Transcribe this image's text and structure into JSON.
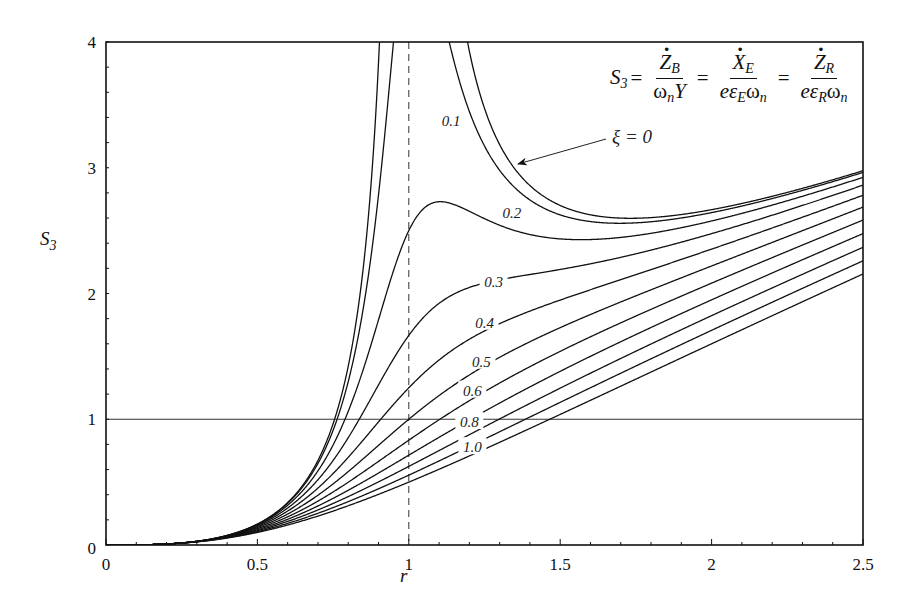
{
  "chart_data": {
    "type": "line",
    "title": "",
    "xlabel": "r",
    "ylabel": "S3",
    "xlim": [
      0,
      2.5
    ],
    "ylim": [
      0,
      4
    ],
    "grid": false,
    "x_ticks": [
      "0",
      "0.5",
      "1",
      "1.5",
      "2",
      "2.5"
    ],
    "y_ticks": [
      "0",
      "1",
      "2",
      "3",
      "4"
    ],
    "reference_lines": [
      {
        "type": "horizontal",
        "y": 1,
        "style": "solid"
      },
      {
        "type": "vertical",
        "x": 1,
        "style": "dashed"
      }
    ],
    "formula": "S3 = Ż_B/(ω_n Y) = Ẋ_E/(e ε_E ω_n) = Ż_R/(e ε_R ω_n)",
    "model": "S3 = r^3 / sqrt((1 - r^2)^2 + (2*xi*r)^2)",
    "annotation": {
      "text": "ξ = 0",
      "points_to_series": "ξ=0"
    },
    "x": [
      0,
      0.25,
      0.5,
      0.75,
      1.0,
      1.1,
      1.25,
      1.5,
      1.75,
      2.0,
      2.25,
      2.5
    ],
    "series": [
      {
        "name": "ξ=0",
        "label": "",
        "values": [
          0,
          0.017,
          0.167,
          0.964,
          null,
          6.34,
          3.47,
          2.7,
          2.6,
          2.67,
          2.8,
          2.98
        ]
      },
      {
        "name": "ξ=0.1",
        "label": "0.1",
        "values": [
          0,
          0.017,
          0.166,
          0.942,
          5.0,
          4.51,
          3.36,
          2.67,
          2.59,
          2.66,
          2.8,
          2.97
        ]
      },
      {
        "name": "ξ=0.2",
        "label": "0.2",
        "values": [
          0,
          0.016,
          0.163,
          0.886,
          2.5,
          2.73,
          2.92,
          2.55,
          2.54,
          2.63,
          2.78,
          2.96
        ]
      },
      {
        "name": "ξ=0.3",
        "label": "0.3",
        "values": [
          0,
          0.016,
          0.159,
          0.814,
          1.67,
          1.96,
          2.26,
          2.32,
          2.45,
          2.59,
          2.75,
          2.93
        ]
      },
      {
        "name": "ξ=0.4",
        "label": "0.4",
        "values": [
          0,
          0.016,
          0.153,
          0.739,
          1.25,
          1.48,
          1.88,
          2.1,
          2.33,
          2.53,
          2.71,
          2.89
        ]
      },
      {
        "name": "ξ=0.5",
        "label": "0.5",
        "values": [
          0,
          0.016,
          0.147,
          0.668,
          1.0,
          1.19,
          1.5,
          1.88,
          2.18,
          2.44,
          2.66,
          2.85
        ]
      },
      {
        "name": "ξ=0.6",
        "label": "0.6",
        "values": [
          0,
          0.015,
          0.14,
          0.605,
          0.833,
          0.99,
          1.25,
          1.67,
          2.02,
          2.33,
          2.59,
          2.8
        ]
      },
      {
        "name": "ξ=0.7",
        "label": "",
        "values": [
          0,
          0.015,
          0.133,
          0.55,
          0.714,
          0.85,
          1.07,
          1.49,
          1.86,
          2.22,
          2.51,
          2.74
        ]
      },
      {
        "name": "ξ=0.8",
        "label": "0.8",
        "values": [
          0,
          0.014,
          0.127,
          0.502,
          0.625,
          0.74,
          0.94,
          1.34,
          1.72,
          2.1,
          2.43,
          2.68
        ]
      },
      {
        "name": "ξ=0.9",
        "label": "",
        "values": [
          0,
          0.014,
          0.12,
          0.461,
          0.556,
          0.66,
          0.83,
          1.21,
          1.59,
          1.99,
          2.34,
          2.62
        ]
      },
      {
        "name": "ξ=1.0",
        "label": "1.0",
        "values": [
          0,
          0.014,
          0.114,
          0.425,
          0.5,
          0.58,
          0.75,
          1.1,
          1.48,
          1.89,
          2.25,
          2.16
        ]
      }
    ],
    "xi_values": [
      0,
      0.1,
      0.2,
      0.3,
      0.4,
      0.5,
      0.6,
      0.7,
      0.8,
      0.9,
      1.0
    ],
    "curve_labels": [
      {
        "text": "0.1",
        "xi": 0.1,
        "x": 1.14,
        "y": 3.36
      },
      {
        "text": "0.2",
        "xi": 0.2,
        "x": 1.34,
        "y": 2.63
      },
      {
        "text": "0.3",
        "xi": 0.3,
        "x": 1.28,
        "y": 2.08
      },
      {
        "text": "0.4",
        "xi": 0.4,
        "x": 1.25,
        "y": 1.76
      },
      {
        "text": "0.5",
        "xi": 0.5,
        "x": 1.24,
        "y": 1.45
      },
      {
        "text": "0.6",
        "xi": 0.6,
        "x": 1.21,
        "y": 1.22
      },
      {
        "text": "0.8",
        "xi": 0.8,
        "x": 1.2,
        "y": 0.97
      },
      {
        "text": "1.0",
        "xi": 1.0,
        "x": 1.21,
        "y": 0.77
      }
    ]
  },
  "labels": {
    "y_axis_title": "S",
    "y_axis_sub": "3",
    "x_axis_title": "r",
    "annotation": "ξ = 0",
    "y_ticks": [
      "0",
      "1",
      "2",
      "3",
      "4"
    ],
    "x_ticks": [
      "0",
      "0.5",
      "1",
      "1.5",
      "2",
      "2.5"
    ]
  },
  "formula": {
    "lhs": "S",
    "lhs_sub": "3",
    "eq": "=",
    "f1_num": "Z",
    "f1_num_sub": "B",
    "f1_den_a": "ω",
    "f1_den_a_sub": "n",
    "f1_den_b": "Y",
    "f2_num": "X",
    "f2_num_sub": "E",
    "f2_den_a": "eε",
    "f2_den_a_sub": "E",
    "f2_den_b": "ω",
    "f2_den_b_sub": "n",
    "f3_num": "Z",
    "f3_num_sub": "R",
    "f3_den_a": "eε",
    "f3_den_a_sub": "R",
    "f3_den_b": "ω",
    "f3_den_b_sub": "n"
  }
}
